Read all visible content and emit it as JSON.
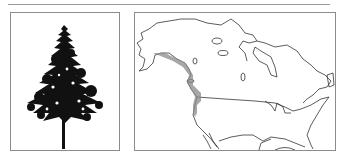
{
  "figure": {
    "panels": [
      {
        "id": "tree-illustration",
        "subject": "conifer tree silhouette",
        "icon": "pine-tree-icon"
      },
      {
        "id": "range-map",
        "subject": "North America outline map",
        "icon": "range-map-icon",
        "range_region": "Pacific coast (southern Alaska to northern California)"
      }
    ],
    "colors": {
      "rule": "#9a9a9a",
      "border": "#8c8c8c",
      "tree": "#111111",
      "coastline": "#333333",
      "range_shading": "#8a8a8a"
    }
  }
}
